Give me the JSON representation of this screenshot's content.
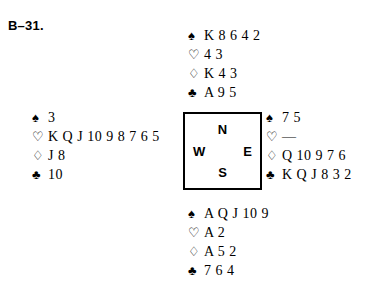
{
  "board": {
    "label": "B–31."
  },
  "suits": {
    "spade_symbol": "♠",
    "heart_symbol": "♡",
    "diamond_symbol": "♢",
    "club_symbol": "♣",
    "void_mark": "—"
  },
  "compass": {
    "north": "N",
    "west": "W",
    "east": "E",
    "south": "S"
  },
  "hands": {
    "north": {
      "position": "North",
      "spades": "K 8 6 4 2",
      "hearts": "4 3",
      "diamonds": "K 4 3",
      "clubs": "A 9 5"
    },
    "west": {
      "position": "West",
      "spades": "3",
      "hearts": "K Q J 10 9 8 7 6 5",
      "diamonds": "J 8",
      "clubs": "10"
    },
    "east": {
      "position": "East",
      "spades": "7 5",
      "hearts": "—",
      "diamonds": "Q 10 9 7 6",
      "clubs": "K Q J 8 3 2"
    },
    "south": {
      "position": "South",
      "spades": "A Q J 10 9",
      "hearts": "A 2",
      "diamonds": "A 5 2",
      "clubs": "7 6 4"
    }
  }
}
